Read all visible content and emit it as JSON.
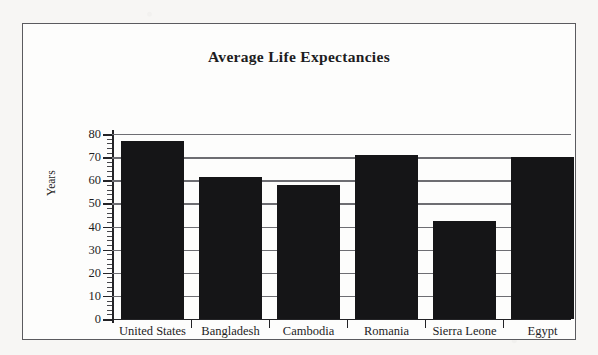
{
  "chart": {
    "title": "Average Life Expectancies",
    "ylabel": "Years"
  },
  "chart_data": {
    "type": "bar",
    "title": "Average Life Expectancies",
    "xlabel": "",
    "ylabel": "Years",
    "ylim": [
      0,
      80
    ],
    "ytick_step": 10,
    "yticks": [
      "0",
      "10",
      "20",
      "30",
      "40",
      "50",
      "60",
      "70",
      "80"
    ],
    "grid": true,
    "legend": false,
    "bar_color": "#151517",
    "categories": [
      "United States",
      "Bangladesh",
      "Cambodia",
      "Romania",
      "Sierra Leone",
      "Egypt"
    ],
    "values": [
      77,
      61.5,
      58,
      71,
      42.5,
      70
    ]
  }
}
